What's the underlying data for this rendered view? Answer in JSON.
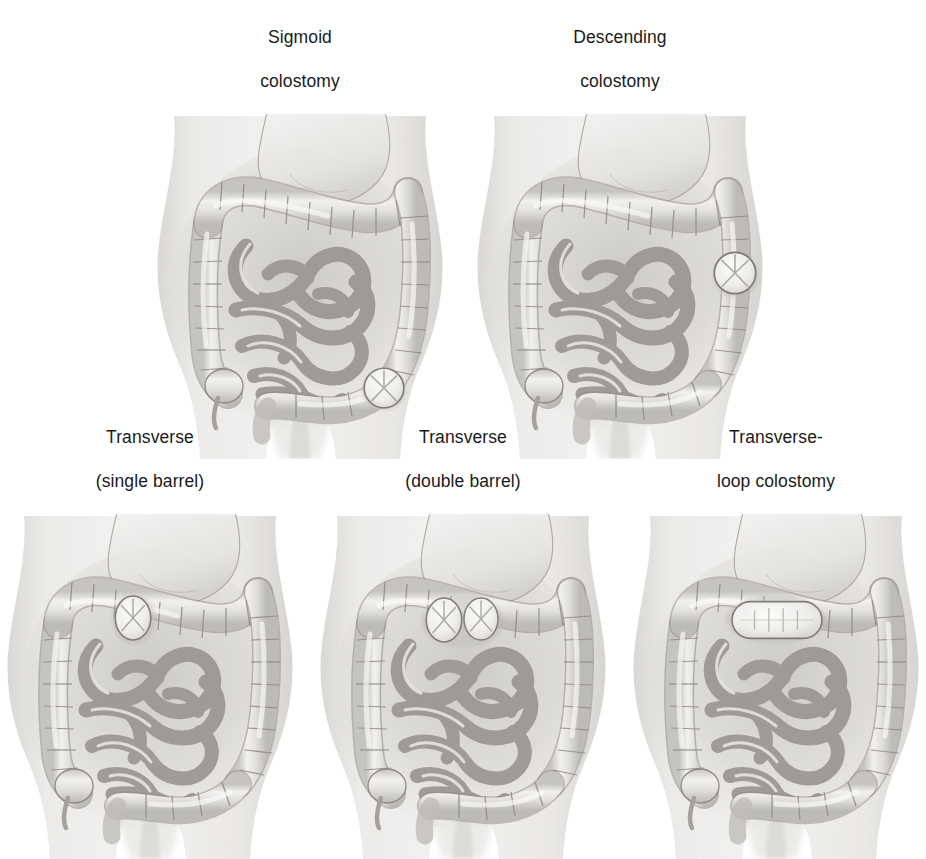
{
  "figure": {
    "background_color": "#ffffff",
    "rows": 2,
    "columns_top": 2,
    "columns_bottom": 3,
    "total_panels": 5
  },
  "palette": {
    "background": "#ffffff",
    "skin": "#f1f0ee",
    "skin_shadow": "#dedcd8",
    "colon_fill": "#e4e2df",
    "colon_shade": "#c9c7c3",
    "outline": "#8b8885",
    "outline_dark": "#6e6b68",
    "small_bowel": "#ebe9e6",
    "stomach": "#ededea",
    "stoma_fill": "#f4f3f1",
    "stoma_line": "#9a9793",
    "text": "#1a1a1a"
  },
  "panels": [
    {
      "id": "sigmoid",
      "caption_lines": [
        "Sigmoid",
        "colostomy"
      ],
      "caption_full": "Sigmoid colostomy",
      "stoma_type": "single",
      "stoma_shape": "round",
      "stoma_count": 1,
      "stoma_location": "sigmoid colon, lower left abdomen",
      "stoma_marker": "x-cross"
    },
    {
      "id": "descending",
      "caption_lines": [
        "Descending",
        "colostomy"
      ],
      "caption_full": "Descending colostomy",
      "stoma_type": "single",
      "stoma_shape": "round",
      "stoma_count": 1,
      "stoma_location": "descending colon, mid-left abdomen",
      "stoma_marker": "x-cross"
    },
    {
      "id": "transverse-single-barrel",
      "caption_lines": [
        "Transverse",
        "(single barrel)"
      ],
      "caption_full": "Transverse (single barrel)",
      "stoma_type": "single barrel",
      "stoma_shape": "oval",
      "stoma_count": 1,
      "stoma_location": "transverse colon, upper mid abdomen",
      "stoma_marker": "x-cross"
    },
    {
      "id": "transverse-double-barrel",
      "caption_lines": [
        "Transverse",
        "(double barrel)"
      ],
      "caption_full": "Transverse (double barrel)",
      "stoma_type": "double barrel",
      "stoma_shape": "oval",
      "stoma_count": 2,
      "stoma_location": "transverse colon, upper mid abdomen",
      "stoma_marker": "x-cross"
    },
    {
      "id": "transverse-loop",
      "caption_lines": [
        "Transverse-",
        "loop colostomy"
      ],
      "caption_full": "Transverse-loop colostomy",
      "stoma_type": "loop",
      "stoma_shape": "elongated-rounded-rectangle",
      "stoma_count": 1,
      "stoma_location": "transverse colon, upper mid abdomen",
      "stoma_marker": "loop-ridge"
    }
  ],
  "anatomy_labels": [
    "torso",
    "stomach",
    "transverse colon",
    "ascending colon",
    "descending colon",
    "sigmoid colon",
    "cecum",
    "appendix",
    "small intestine",
    "rectum"
  ]
}
